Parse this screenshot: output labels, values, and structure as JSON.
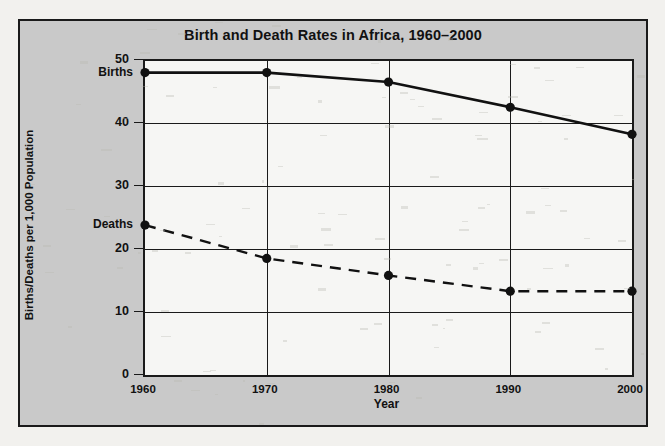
{
  "chart_data": {
    "type": "line",
    "title": "Birth and Death Rates in Africa, 1960–2000",
    "xlabel": "Year",
    "ylabel": "Births/Deaths per 1,000 Population",
    "x": [
      1960,
      1970,
      1980,
      1990,
      2000
    ],
    "xticklabels": [
      "1960",
      "1970",
      "1980",
      "1990",
      "2000"
    ],
    "yticks": [
      0,
      10,
      20,
      30,
      40,
      50
    ],
    "yticklabels": [
      "0",
      "10",
      "20",
      "30",
      "40",
      "50"
    ],
    "ylim": [
      0,
      50
    ],
    "xlim": [
      1960,
      2000
    ],
    "grid": true,
    "legend_position": "inline-left-of-first-point",
    "series": [
      {
        "name": "Births",
        "label": "Births",
        "style": "solid",
        "marker": "filled-circle",
        "color": "#111111",
        "values": [
          48.0,
          48.0,
          46.5,
          42.5,
          38.2
        ]
      },
      {
        "name": "Deaths",
        "label": "Deaths",
        "style": "dashed",
        "marker": "filled-circle",
        "color": "#111111",
        "values": [
          23.8,
          18.5,
          15.8,
          13.3,
          13.3
        ]
      }
    ]
  },
  "figure": {
    "background_color": "#c9c9c9",
    "plot_background_color": "#f6f6f4",
    "border_color": "#1a1a1a",
    "page_background_color": "#f2f1ee"
  }
}
